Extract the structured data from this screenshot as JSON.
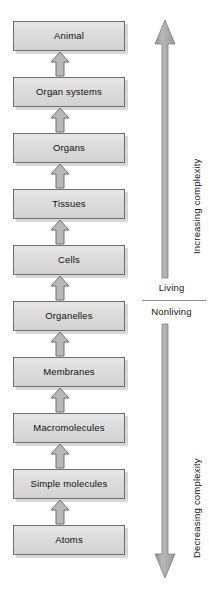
{
  "diagram": {
    "type": "hierarchy-flow",
    "hierarchy": {
      "levels": [
        {
          "label": "Animal"
        },
        {
          "label": "Organ systems"
        },
        {
          "label": "Organs"
        },
        {
          "label": "Tissues"
        },
        {
          "label": "Cells"
        },
        {
          "label": "Organelles"
        },
        {
          "label": "Membranes"
        },
        {
          "label": "Macromolecules"
        },
        {
          "label": "Simple molecules"
        },
        {
          "label": "Atoms"
        }
      ],
      "arrow_direction": "up"
    },
    "complexity_axis": {
      "upper_arrow_label": "Increasing complexity",
      "upper_arrow_direction": "up",
      "lower_arrow_label": "Decreasing complexity",
      "lower_arrow_direction": "down",
      "divider": {
        "above_label": "Living",
        "below_label": "Nonliving"
      }
    },
    "colors": {
      "box_fill": "#dcdcdc",
      "box_border": "#6e6e6e",
      "arrow_fill": "#b4b4b4",
      "arrow_border": "#707070",
      "text": "#101010"
    }
  }
}
